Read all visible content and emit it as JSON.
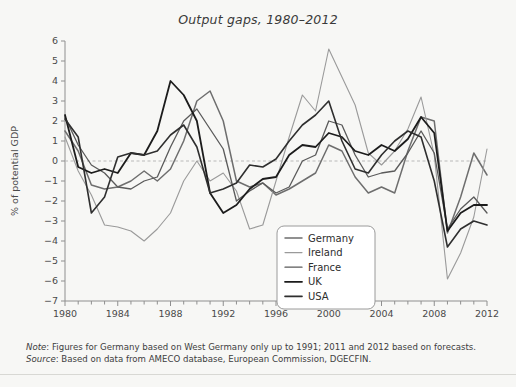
{
  "figure": {
    "title": "Output gaps, 1980–2012",
    "background_color": "#f7f7f5"
  },
  "footnotes": {
    "note_label": "Note",
    "note_text": ": Figures for Germany based on West Germany only up to 1991; 2011 and 2012 based on forecasts.",
    "source_label": "Source",
    "source_text": ": Based on data from AMECO database, European Commission, DGECFIN."
  },
  "axes": {
    "y_axis_title": "% of potential GDP",
    "y_ticks": [
      "6",
      "5",
      "4",
      "3",
      "2",
      "1",
      "0",
      "−1",
      "−2",
      "−3",
      "−4",
      "−5",
      "−6",
      "−7"
    ],
    "x_ticks": [
      "1980",
      "1984",
      "1988",
      "1992",
      "1996",
      "2000",
      "2004",
      "2008",
      "2012"
    ],
    "zero_line_color": "#b9b9b9"
  },
  "legend": {
    "position": "inside-bottom-center",
    "items": [
      {
        "label": "Germany",
        "color": "#6e6e6e",
        "width": 1.5
      },
      {
        "label": "Ireland",
        "color": "#9a9a9a",
        "width": 1.1
      },
      {
        "label": "France",
        "color": "#5a5a5a",
        "width": 1.3
      },
      {
        "label": "UK",
        "color": "#1c1c1c",
        "width": 1.8
      },
      {
        "label": "USA",
        "color": "#2f2f2f",
        "width": 1.6
      }
    ]
  },
  "chart_data": {
    "type": "line",
    "title": "Output gaps, 1980–2012",
    "xlabel": "",
    "ylabel": "% of potential GDP",
    "xlim": [
      1980,
      2012
    ],
    "ylim": [
      -7,
      6
    ],
    "grid": false,
    "legend_position": "inside-bottom-center",
    "x": [
      1980,
      1981,
      1982,
      1983,
      1984,
      1985,
      1986,
      1987,
      1988,
      1989,
      1990,
      1991,
      1992,
      1993,
      1994,
      1995,
      1996,
      1997,
      1998,
      1999,
      2000,
      2001,
      2002,
      2003,
      2004,
      2005,
      2006,
      2007,
      2008,
      2009,
      2010,
      2011,
      2012
    ],
    "series": [
      {
        "name": "Germany",
        "color": "#6e6e6e",
        "values": [
          1.5,
          0.5,
          -1.2,
          -1.4,
          -1.3,
          -1.0,
          -0.5,
          -1.0,
          -0.4,
          1.0,
          3.0,
          3.5,
          2.0,
          -1.0,
          -1.3,
          -1.1,
          -1.7,
          -1.4,
          -1.0,
          -0.6,
          0.8,
          0.5,
          -0.8,
          -1.6,
          -1.3,
          -1.6,
          0.5,
          2.2,
          2.0,
          -3.6,
          -1.8,
          0.4,
          -0.7
        ]
      },
      {
        "name": "Ireland",
        "color": "#9a9a9a",
        "values": [
          1.2,
          -0.5,
          -1.7,
          -3.2,
          -3.3,
          -3.5,
          -4.0,
          -3.4,
          -2.6,
          -1.0,
          0.0,
          -1.0,
          -0.6,
          -1.5,
          -3.4,
          -3.2,
          -1.0,
          1.2,
          3.3,
          2.5,
          5.6,
          4.2,
          2.8,
          0.4,
          -0.2,
          0.5,
          1.6,
          3.2,
          0.3,
          -5.9,
          -4.6,
          -2.8,
          0.6
        ]
      },
      {
        "name": "France",
        "color": "#5a5a5a",
        "values": [
          2.2,
          0.8,
          -0.2,
          -0.6,
          -1.3,
          -1.4,
          -1.0,
          -0.8,
          0.7,
          2.0,
          2.6,
          1.6,
          0.6,
          -2.0,
          -1.5,
          -1.1,
          -1.6,
          -1.3,
          0.0,
          0.3,
          2.0,
          1.8,
          0.3,
          -0.8,
          -0.6,
          -0.5,
          0.4,
          1.5,
          0.4,
          -3.4,
          -2.4,
          -1.8,
          -2.6
        ]
      },
      {
        "name": "UK",
        "color": "#1c1c1c",
        "values": [
          2.3,
          -0.3,
          -0.6,
          -0.4,
          -0.6,
          0.4,
          0.3,
          1.5,
          4.0,
          3.3,
          2.0,
          -1.6,
          -2.6,
          -2.2,
          -1.4,
          -0.9,
          -0.8,
          0.3,
          0.8,
          0.7,
          1.4,
          1.2,
          0.5,
          0.3,
          0.8,
          0.5,
          1.1,
          2.2,
          1.4,
          -3.5,
          -2.6,
          -2.2,
          -2.2
        ]
      },
      {
        "name": "USA",
        "color": "#2f2f2f",
        "values": [
          2.1,
          1.2,
          -2.6,
          -1.8,
          0.2,
          0.4,
          0.3,
          0.5,
          1.3,
          1.8,
          0.7,
          -1.6,
          -1.4,
          -1.1,
          -0.2,
          -0.3,
          0.1,
          1.0,
          1.8,
          2.3,
          3.0,
          1.0,
          -0.4,
          -0.6,
          0.3,
          1.0,
          1.5,
          1.2,
          -1.0,
          -4.3,
          -3.4,
          -3.0,
          -3.2
        ]
      }
    ]
  }
}
